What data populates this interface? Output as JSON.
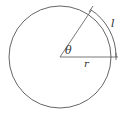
{
  "diagram": {
    "title": "",
    "type": "circle-arc-length",
    "labels": {
      "angle": "θ",
      "radius": "r",
      "arc_length": "l"
    },
    "colors": {
      "stroke": "#555555",
      "text": "#333333",
      "background": "#ffffff"
    },
    "geometry": {
      "center": [
        60,
        57
      ],
      "radius": 51,
      "angle_degrees": 57,
      "arc_offset": 5
    }
  }
}
